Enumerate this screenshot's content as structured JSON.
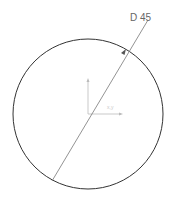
{
  "drawing": {
    "dimension_label": "D 45",
    "axis_label": "x,y",
    "circle": {
      "cx": 88,
      "cy": 114,
      "r": 75,
      "stroke": "#333333"
    },
    "dimension_line": {
      "x1": 52,
      "y1": 181,
      "x2": 148,
      "y2": 20,
      "stroke": "#777777"
    },
    "axes": {
      "origin": [
        88,
        114
      ],
      "x_end": [
        121,
        114
      ],
      "y_end": [
        88,
        80
      ],
      "stroke": "#bbbbbb"
    }
  }
}
